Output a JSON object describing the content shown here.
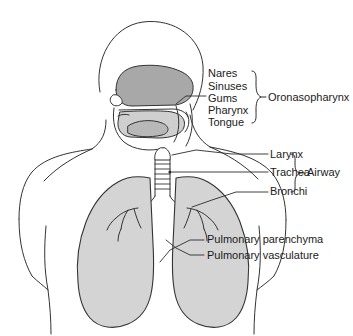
{
  "figure": {
    "type": "anatomical-diagram",
    "colors": {
      "background": "#ffffff",
      "stroke": "#333333",
      "lung_fill": "#d4d4d4",
      "sinus_fill": "#a8a8a8",
      "oral_fill": "#cfcfcf",
      "text": "#1a1a1a",
      "leader": "#2b2b2b"
    }
  },
  "groups": [
    {
      "id": "oronasopharynx",
      "bracket_label": "Oronasopharynx",
      "items": [
        "Nares",
        "Sinuses",
        "Gums",
        "Pharynx",
        "Tongue"
      ]
    },
    {
      "id": "airway",
      "bracket_label": "Airway",
      "items": [
        "Larynx",
        "Trachea",
        "Bronchi"
      ]
    }
  ],
  "labels": {
    "nares": "Nares",
    "sinuses": "Sinuses",
    "gums": "Gums",
    "pharynx": "Pharynx",
    "tongue": "Tongue",
    "oronasopharynx": "Oronasopharynx",
    "larynx": "Larynx",
    "trachea": "Trachea",
    "bronchi": "Bronchi",
    "airway": "Airway",
    "pulmonary_parenchyma": "Pulmonary parenchyma",
    "pulmonary_vasculature": "Pulmonary vasculature"
  },
  "structures": [
    "head-outline",
    "neck",
    "torso-outline",
    "shoulder-left",
    "shoulder-right",
    "nasal-sinus-cavity",
    "oral-cavity",
    "tongue",
    "soft-palate",
    "pharynx-passage",
    "larynx",
    "trachea-rings",
    "carina",
    "bronchus-left",
    "bronchus-right",
    "lung-left",
    "lung-right",
    "bronchial-tree-left",
    "bronchial-tree-right"
  ]
}
